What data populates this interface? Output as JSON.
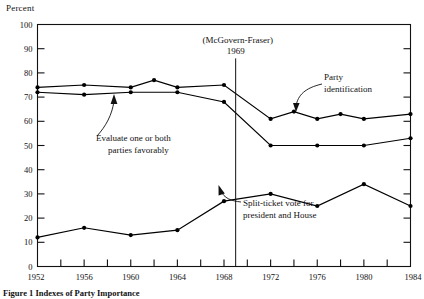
{
  "figure": {
    "y_axis_title": "Percent",
    "caption": "Figure 1 Indexes of Party Importance"
  },
  "chart_data": {
    "type": "line",
    "title": "",
    "xlabel": "",
    "ylabel": "Percent",
    "xlim": [
      1952,
      1984
    ],
    "ylim": [
      0,
      100
    ],
    "xticks": [
      1952,
      1954,
      1956,
      1958,
      1960,
      1962,
      1964,
      1966,
      1968,
      1970,
      1972,
      1974,
      1976,
      1978,
      1980,
      1982,
      1984
    ],
    "xtick_labels": [
      "1952",
      "",
      "1956",
      "",
      "1960",
      "",
      "1964",
      "",
      "1968",
      "",
      "1972",
      "",
      "1976",
      "",
      "1980",
      "",
      "1984"
    ],
    "yticks": [
      0,
      10,
      20,
      30,
      40,
      50,
      60,
      70,
      80,
      90,
      100
    ],
    "ytick_labels": [
      "0",
      "10",
      "20",
      "30",
      "40",
      "50",
      "60",
      "70",
      "80",
      "90",
      "100"
    ],
    "grid": false,
    "legend_position": "inline-annotations",
    "marker": "filled-circle",
    "line_color": "#000000",
    "series": [
      {
        "name": "Party identification",
        "x": [
          1952,
          1956,
          1960,
          1962,
          1964,
          1968,
          1972,
          1974,
          1976,
          1978,
          1980,
          1984
        ],
        "values": [
          74,
          75,
          74,
          77,
          74,
          75,
          61,
          64,
          61,
          63,
          61,
          63
        ]
      },
      {
        "name": "Evaluate one or both parties favorably",
        "x": [
          1952,
          1956,
          1960,
          1964,
          1968,
          1972,
          1976,
          1980,
          1984
        ],
        "values": [
          72,
          71,
          72,
          72,
          68,
          50,
          50,
          50,
          53
        ]
      },
      {
        "name": "Split-ticket vote for president and House",
        "x": [
          1952,
          1956,
          1960,
          1964,
          1968,
          1972,
          1976,
          1980,
          1984
        ],
        "values": [
          12,
          16,
          13,
          15,
          27,
          30,
          25,
          34,
          25
        ]
      }
    ],
    "annotations": [
      {
        "name": "mcgovern-fraser",
        "line1": "(McGovern-Fraser)",
        "line2": "1969",
        "vline_x": 1969,
        "vline_y_top": 86,
        "vline_y_bottom": 0
      },
      {
        "name": "party-identification-label",
        "line1": "Party",
        "line2": "identification",
        "target_x": 1973,
        "target_y": 63
      },
      {
        "name": "evaluate-parties-label",
        "line1": "Evaluate one or both",
        "line2": "parties favorably",
        "target_x": 1960,
        "target_y": 72
      },
      {
        "name": "split-ticket-label",
        "line1": "Split-ticket vote for",
        "line2": "president and House",
        "target_x": 1968,
        "target_y": 27
      }
    ]
  }
}
